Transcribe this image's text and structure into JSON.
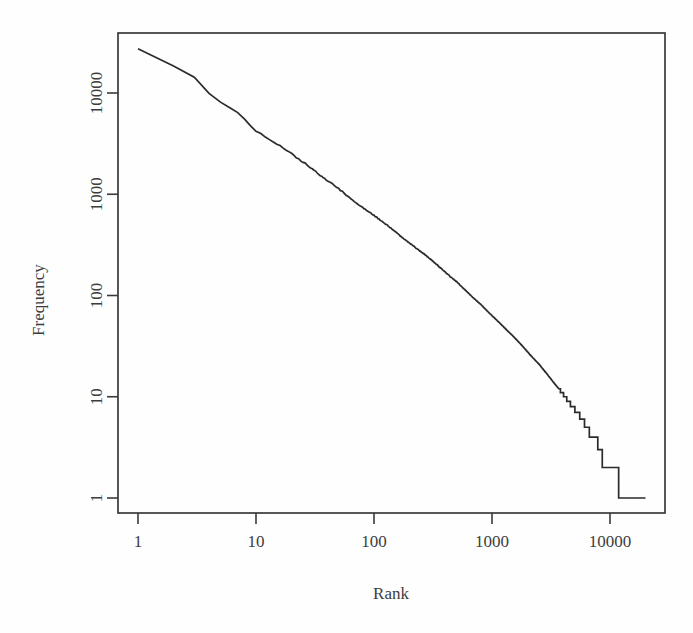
{
  "chart_data": {
    "type": "line",
    "title": "",
    "subtitle": "",
    "xlabel": "Rank",
    "ylabel": "Frequency",
    "xscale": "log",
    "yscale": "log",
    "grid": false,
    "legend": null,
    "xlim": [
      1,
      30000
    ],
    "ylim": [
      1,
      40000
    ],
    "xticks": [
      1,
      10,
      100,
      1000,
      10000
    ],
    "xtick_labels": [
      "1",
      "10",
      "100",
      "1000",
      "10000"
    ],
    "yticks": [
      1,
      10,
      100,
      1000,
      10000
    ],
    "ytick_labels": [
      "1",
      "10",
      "100",
      "1000",
      "10000"
    ],
    "annotations": [],
    "series": [
      {
        "name": "rank-frequency",
        "x": [
          1,
          2,
          3,
          4,
          5,
          6,
          7,
          8,
          9,
          10,
          12,
          14,
          16,
          18,
          20,
          24,
          28,
          32,
          36,
          40,
          48,
          56,
          64,
          72,
          80,
          96,
          112,
          128,
          150,
          175,
          200,
          240,
          280,
          320,
          380,
          440,
          500,
          600,
          700,
          800,
          950,
          1100,
          1300,
          1500,
          1800,
          2100,
          2500,
          2900,
          3300,
          3800,
          4300,
          4800,
          5300,
          5800,
          6400,
          7000,
          7600,
          8200,
          9000,
          11000,
          13000,
          16000,
          20000
        ],
        "y": [
          27000,
          18500,
          14500,
          9800,
          8200,
          7200,
          6400,
          5500,
          4700,
          4200,
          3700,
          3300,
          3000,
          2750,
          2500,
          2150,
          1900,
          1680,
          1500,
          1380,
          1180,
          1020,
          900,
          810,
          740,
          640,
          560,
          500,
          430,
          370,
          330,
          280,
          245,
          215,
          180,
          155,
          137,
          112,
          94,
          82,
          67,
          57,
          47,
          40,
          32,
          26,
          21,
          17,
          14,
          11.5,
          9.5,
          8,
          7,
          6,
          5,
          4,
          4,
          3,
          2,
          2,
          1,
          1,
          1
        ]
      }
    ]
  },
  "axes": {
    "x_title": "Rank",
    "y_title": "Frequency"
  }
}
